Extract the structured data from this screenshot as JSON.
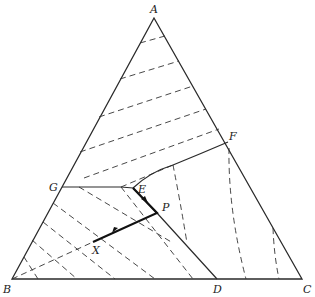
{
  "diagram": {
    "type": "ternary-phase-diagram",
    "vertices": {
      "A": {
        "label": "A",
        "x": 154,
        "y": 18
      },
      "B": {
        "label": "B",
        "x": 12,
        "y": 279
      },
      "C": {
        "label": "C",
        "x": 302,
        "y": 279
      }
    },
    "points": {
      "D": {
        "label": "D",
        "x": 217,
        "y": 279
      },
      "E": {
        "label": "E",
        "x": 133,
        "y": 188
      },
      "F": {
        "label": "F",
        "x": 228,
        "y": 142
      },
      "G": {
        "label": "G",
        "x": 62,
        "y": 187
      },
      "P": {
        "label": "P",
        "x": 157,
        "y": 213
      },
      "X": {
        "label": "X",
        "x": 93,
        "y": 242
      }
    },
    "labels": {
      "A": "A",
      "B": "B",
      "C": "C",
      "D": "D",
      "E": "E",
      "F": "F",
      "G": "G",
      "P": "P",
      "X": "X"
    },
    "colors": {
      "line": "#2a2a2a",
      "background": "#ffffff"
    }
  }
}
